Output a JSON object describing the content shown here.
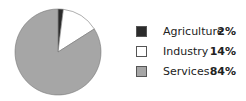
{
  "chart_data": {
    "type": "pie",
    "title": "",
    "categories": [
      "Agriculture",
      "Industry",
      "Services"
    ],
    "values": [
      2,
      14,
      84
    ],
    "labels": [
      "2%",
      "14%",
      "84%"
    ],
    "colors": [
      "#2b2b2b",
      "#ffffff",
      "#a6a6a6"
    ],
    "start_angle": "top, clockwise",
    "legend_position": "right"
  },
  "legend": [
    {
      "label": "Agriculture",
      "value": "2%",
      "color": "#2b2b2b"
    },
    {
      "label": "Industry",
      "value": "14%",
      "color": "#ffffff"
    },
    {
      "label": "Services",
      "value": "84%",
      "color": "#a6a6a6"
    }
  ]
}
